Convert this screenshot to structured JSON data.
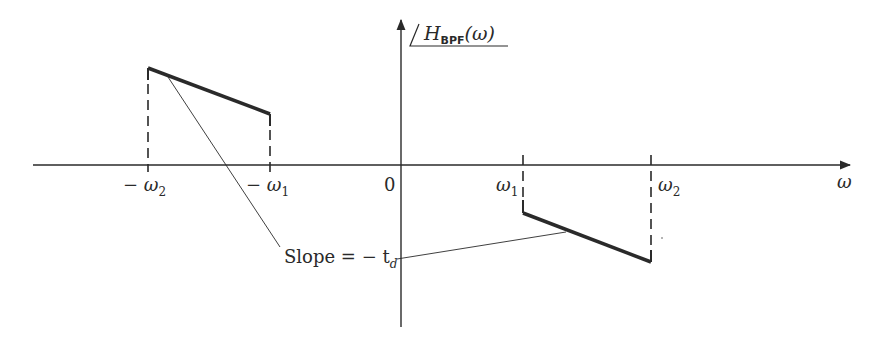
{
  "diagram": {
    "type": "phase-response-plot",
    "title_label": {
      "main": "H",
      "subscript": "BPF",
      "argument": "(ω)",
      "prefix_symbol": "∠"
    },
    "axes": {
      "x_label": "ω",
      "origin_label": "0",
      "x_ticks": [
        {
          "label_main": "− ω",
          "label_sub": "2"
        },
        {
          "label_main": "− ω",
          "label_sub": "1"
        },
        {
          "label_main": "ω",
          "label_sub": "1"
        },
        {
          "label_main": "ω",
          "label_sub": "2"
        }
      ]
    },
    "annotation": {
      "text": "Slope = − t",
      "subscript": "d"
    },
    "colors": {
      "line": "#2a2a2a",
      "background": "#ffffff"
    }
  }
}
